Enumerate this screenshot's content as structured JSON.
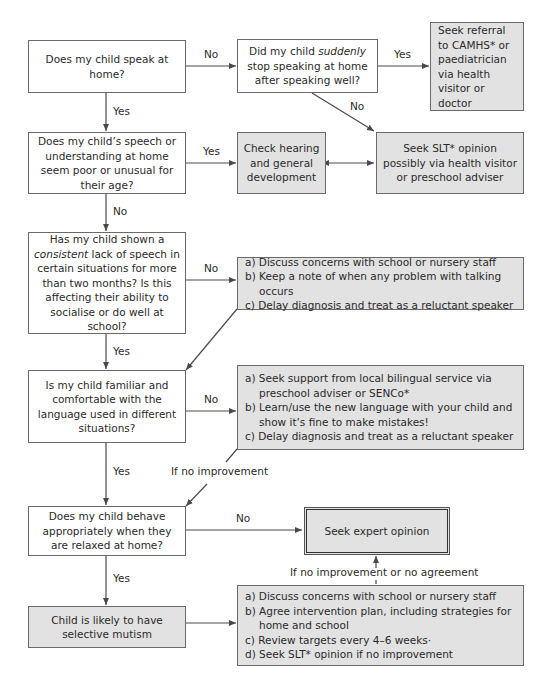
{
  "diagram": {
    "type": "flowchart",
    "nodes": {
      "q_speak_home": "Does my child speak at home?",
      "q_suddenly": {
        "pre": "Did my child ",
        "em": "suddenly",
        "post": " stop speaking at home after speaking well?"
      },
      "camhs": "Seek referral to CAMHS* or paediatrician via health visitor or doctor",
      "q_speech_poor": "Does my child’s speech or understanding at home seem poor or unusual for their age?",
      "check_hearing": "Check hearing and general development",
      "seek_slt": "Seek SLT* opinion possibly via health visitor or preschool adviser",
      "q_consistent": {
        "pre": "Has my child shown a ",
        "em": "consistent",
        "post": " lack of speech in certain situations for more than two months? Is this affecting their ability to socialise or do well at school?"
      },
      "actions_1": [
        "a) Discuss concerns with school or nursery staff",
        "b) Keep a note of when any problem with talking occurs",
        "c) Delay diagnosis and treat as a reluctant speaker"
      ],
      "q_language": "Is my child familiar and comfortable with the language used in different situations?",
      "actions_2": [
        "a) Seek support from local bilingual service via preschool adviser or SENCo*",
        "b) Learn/use the new language with your child and show it’s fine to make mistakes!",
        "c) Delay diagnosis and treat as a reluctant speaker"
      ],
      "q_behave": "Does my child behave appropriately when they are relaxed at home?",
      "expert": "Seek expert opinion",
      "selective_mutism": "Child is likely to have selective mutism",
      "actions_3": [
        "a) Discuss concerns with school or nursery staff",
        "b) Agree intervention plan, including strategies for home and school",
        "c) Review targets every 4–6 weeks·",
        "d) Seek SLT* opinion if no improvement"
      ]
    },
    "edge_labels": {
      "speak_no": "No",
      "speak_yes": "Yes",
      "suddenly_yes": "Yes",
      "suddenly_no": "No",
      "speech_yes": "Yes",
      "speech_no": "No",
      "consistent_no": "No",
      "consistent_yes": "Yes",
      "language_no": "No",
      "language_yes": "Yes",
      "if_no_improvement": "If no improvement",
      "behave_no": "No",
      "behave_yes": "Yes",
      "no_improvement_agreement": "If no improvement or no agreement"
    },
    "colors": {
      "box_fill": "#ffffff",
      "action_fill": "#e2e2e2",
      "line": "#4a4a4a"
    }
  }
}
